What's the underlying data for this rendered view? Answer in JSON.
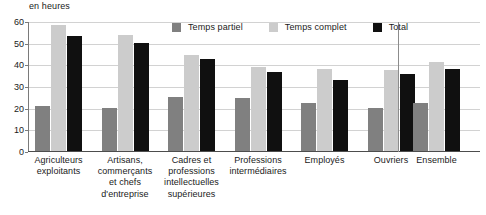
{
  "unit_label": "en heures",
  "colors": {
    "temps_partiel": "#808080",
    "temps_complet": "#cccccc",
    "total": "#101010",
    "gridline": "#d2d2d2",
    "axis": "#4d4d4d",
    "text": "#1a1a1a"
  },
  "legend": {
    "items": [
      {
        "label": "Temps partiel",
        "color": "#808080"
      },
      {
        "label": "Temps complet",
        "color": "#cccccc"
      },
      {
        "label": "Total",
        "color": "#101010"
      }
    ]
  },
  "yaxis": {
    "ticks": [
      "0",
      "10",
      "20",
      "30",
      "40",
      "50",
      "60"
    ],
    "min": 0,
    "max": 60,
    "step": 10
  },
  "chart_data": {
    "type": "bar",
    "title": "",
    "subtitle": "",
    "xlabel": "",
    "ylabel": "en heures",
    "ylim": [
      0,
      60
    ],
    "ytick_step": 10,
    "grid": true,
    "legend_position": "top",
    "categories": [
      "Agriculteurs exploitants",
      "Artisans, commerçants et chefs d'entreprise",
      "Cadres et professions intellectuelles supérieures",
      "Professions intermédiaires",
      "Employés",
      "Ouvriers",
      "Ensemble"
    ],
    "category_lines": [
      [
        "Agriculteurs",
        "exploitants"
      ],
      [
        "Artisans,",
        "commerçants",
        "et chefs",
        "d'entreprise"
      ],
      [
        "Cadres et",
        "professions",
        "intellectuelles",
        "supérieures"
      ],
      [
        "Professions",
        "intermédiaires"
      ],
      [
        "Employés"
      ],
      [
        "Ouvriers"
      ],
      [
        "Ensemble"
      ]
    ],
    "series": [
      {
        "name": "Temps partiel",
        "color": "#808080",
        "values": [
          21,
          20,
          25,
          24.5,
          22,
          20,
          22
        ]
      },
      {
        "name": "Temps complet",
        "color": "#cccccc",
        "values": [
          58,
          53.5,
          44.5,
          39,
          38,
          37.5,
          41
        ]
      },
      {
        "name": "Total",
        "color": "#101010",
        "values": [
          53,
          50,
          42.5,
          36.5,
          33,
          35.5,
          38
        ]
      }
    ]
  }
}
